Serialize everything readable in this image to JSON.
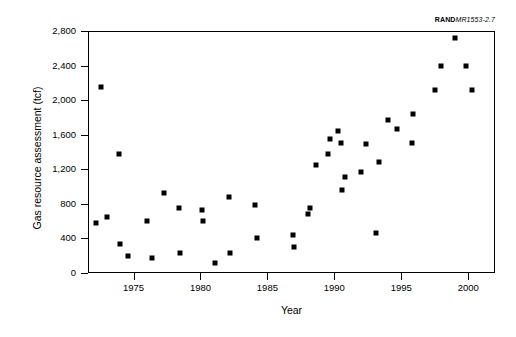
{
  "source_credit": {
    "bold": "RAND",
    "italic": "MR1553-2.7"
  },
  "chart_data": {
    "type": "scatter",
    "title": "",
    "xlabel": "Year",
    "ylabel": "Gas resource assessment (tcf)",
    "xlim": [
      1971.6,
      2002.0
    ],
    "ylim": [
      0,
      2800
    ],
    "grid": false,
    "legend": null,
    "marker": "filled-square",
    "marker_color": "#000000",
    "xticks": [
      1975,
      1980,
      1985,
      1990,
      1995,
      2000
    ],
    "xticklabels": [
      "1975",
      "1980",
      "1985",
      "1990",
      "1995",
      "2000"
    ],
    "yticks": [
      0,
      400,
      800,
      1200,
      1600,
      2000,
      2400,
      2800
    ],
    "yticklabels": [
      "0",
      "400",
      "800",
      "1,200",
      "1,600",
      "2,000",
      "2,400",
      "2,800"
    ],
    "points": [
      {
        "x": 1972.2,
        "y": 580
      },
      {
        "x": 1972.6,
        "y": 2150
      },
      {
        "x": 1973.0,
        "y": 645
      },
      {
        "x": 1973.9,
        "y": 1380
      },
      {
        "x": 1974.0,
        "y": 340
      },
      {
        "x": 1974.6,
        "y": 200
      },
      {
        "x": 1976.0,
        "y": 605
      },
      {
        "x": 1976.4,
        "y": 170
      },
      {
        "x": 1977.3,
        "y": 920
      },
      {
        "x": 1978.4,
        "y": 750
      },
      {
        "x": 1978.5,
        "y": 235
      },
      {
        "x": 1980.1,
        "y": 725
      },
      {
        "x": 1980.2,
        "y": 600
      },
      {
        "x": 1981.1,
        "y": 115
      },
      {
        "x": 1982.1,
        "y": 875
      },
      {
        "x": 1982.2,
        "y": 230
      },
      {
        "x": 1984.1,
        "y": 785
      },
      {
        "x": 1984.2,
        "y": 400
      },
      {
        "x": 1986.9,
        "y": 445
      },
      {
        "x": 1987.0,
        "y": 300
      },
      {
        "x": 1988.0,
        "y": 685
      },
      {
        "x": 1988.2,
        "y": 750
      },
      {
        "x": 1988.6,
        "y": 1245
      },
      {
        "x": 1989.5,
        "y": 1375
      },
      {
        "x": 1989.7,
        "y": 1555
      },
      {
        "x": 1990.3,
        "y": 1640
      },
      {
        "x": 1990.5,
        "y": 1505
      },
      {
        "x": 1990.6,
        "y": 960
      },
      {
        "x": 1990.8,
        "y": 1110
      },
      {
        "x": 1992.0,
        "y": 1170
      },
      {
        "x": 1992.4,
        "y": 1490
      },
      {
        "x": 1993.1,
        "y": 460
      },
      {
        "x": 1993.3,
        "y": 1280
      },
      {
        "x": 1994.0,
        "y": 1775
      },
      {
        "x": 1994.7,
        "y": 1665
      },
      {
        "x": 1995.8,
        "y": 1500
      },
      {
        "x": 1995.9,
        "y": 1840
      },
      {
        "x": 1997.5,
        "y": 2115
      },
      {
        "x": 1998.0,
        "y": 2400
      },
      {
        "x": 1999.0,
        "y": 2715
      },
      {
        "x": 1999.8,
        "y": 2400
      },
      {
        "x": 2000.3,
        "y": 2120
      }
    ]
  }
}
